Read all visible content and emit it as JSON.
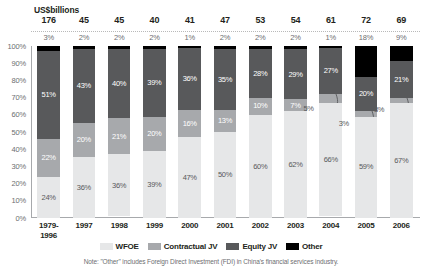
{
  "header": {
    "units_label": "US$billions"
  },
  "legend": {
    "items": [
      {
        "label": "WFOE",
        "color": "#e6e7e8",
        "key": "wfoe"
      },
      {
        "label": "Contractual JV",
        "color": "#a7a9ac",
        "key": "cjv"
      },
      {
        "label": "Equity JV",
        "color": "#58595b",
        "key": "ejv"
      },
      {
        "label": "Other",
        "color": "#000000",
        "key": "oth"
      }
    ]
  },
  "note": "Note: \"Other\" includes Foreign Direct Investment (FDI) in China's financial services industry.",
  "chart_data": {
    "type": "bar",
    "title": "",
    "subtitle": "",
    "xlabel": "",
    "ylabel": "",
    "ylim": [
      0,
      100
    ],
    "grid": false,
    "stacked": true,
    "stack_mode": "percent",
    "legend_position": "bottom",
    "categories": [
      "1979-\n1996",
      "1997",
      "1998",
      "1999",
      "2000",
      "2001",
      "2002",
      "2003",
      "2004",
      "2005",
      "2006"
    ],
    "category_lines": [
      [
        "1979-",
        "1996"
      ],
      [
        "1997"
      ],
      [
        "1998"
      ],
      [
        "1999"
      ],
      [
        "2000"
      ],
      [
        "2001"
      ],
      [
        "2002"
      ],
      [
        "2003"
      ],
      [
        "2004"
      ],
      [
        "2005"
      ],
      [
        "2006"
      ]
    ],
    "ytick_labels": [
      "100%",
      "90%",
      "80%",
      "70%",
      "60%",
      "50%",
      "40%",
      "30%",
      "20%",
      "10%",
      "0%"
    ],
    "ytick_values": [
      100,
      90,
      80,
      70,
      60,
      50,
      40,
      30,
      20,
      10,
      0
    ],
    "totals_row_label": "US$billions",
    "totals": [
      "176",
      "45",
      "45",
      "40",
      "41",
      "47",
      "53",
      "54",
      "61",
      "72",
      "69"
    ],
    "totals_numeric": [
      176,
      45,
      45,
      40,
      41,
      47,
      53,
      54,
      61,
      72,
      69
    ],
    "other_top_labels": [
      "3%",
      "2%",
      "2%",
      "2%",
      "1%",
      "2%",
      "2%",
      "2%",
      "1%",
      "18%",
      "9%"
    ],
    "series": [
      {
        "name": "WFOE",
        "key": "wfoe",
        "color": "#e6e7e8",
        "values": [
          24,
          36,
          36,
          39,
          47,
          50,
          60,
          62,
          66,
          59,
          67
        ],
        "labels": [
          "24%",
          "36%",
          "36%",
          "39%",
          "47%",
          "50%",
          "60%",
          "62%",
          "66%",
          "59%",
          "67%"
        ]
      },
      {
        "name": "Contractual JV",
        "key": "cjv",
        "color": "#a7a9ac",
        "values": [
          22,
          20,
          21,
          20,
          16,
          13,
          10,
          7,
          5,
          3,
          3
        ],
        "labels": [
          "22%",
          "20%",
          "21%",
          "20%",
          "16%",
          "13%",
          "10%",
          "7%",
          "5%",
          "3%",
          "3%"
        ],
        "callout_indices": [
          8,
          9,
          10
        ]
      },
      {
        "name": "Equity JV",
        "key": "ejv",
        "color": "#58595b",
        "values": [
          51,
          43,
          40,
          39,
          36,
          35,
          28,
          29,
          27,
          20,
          21
        ],
        "labels": [
          "51%",
          "43%",
          "40%",
          "39%",
          "36%",
          "35%",
          "28%",
          "29%",
          "27%",
          "20%",
          "21%"
        ]
      },
      {
        "name": "Other",
        "key": "oth",
        "color": "#000000",
        "values": [
          3,
          2,
          2,
          2,
          1,
          2,
          2,
          2,
          1,
          18,
          9
        ],
        "labels": [
          "3%",
          "2%",
          "2%",
          "2%",
          "1%",
          "2%",
          "2%",
          "2%",
          "1%",
          "18%",
          "9%"
        ],
        "labels_above_bar": true
      }
    ]
  }
}
